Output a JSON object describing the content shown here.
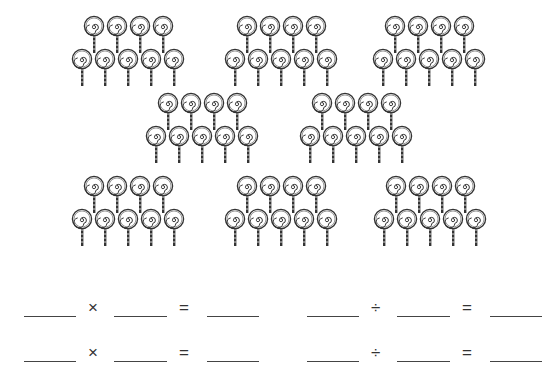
{
  "worksheet": {
    "groups": [
      {
        "x": 68,
        "y": 15,
        "top_count": 4,
        "bottom_count": 5
      },
      {
        "x": 221,
        "y": 15,
        "top_count": 4,
        "bottom_count": 5
      },
      {
        "x": 369,
        "y": 15,
        "top_count": 4,
        "bottom_count": 5
      },
      {
        "x": 142,
        "y": 92,
        "top_count": 4,
        "bottom_count": 5
      },
      {
        "x": 296,
        "y": 92,
        "top_count": 4,
        "bottom_count": 5
      },
      {
        "x": 68,
        "y": 175,
        "top_count": 4,
        "bottom_count": 5
      },
      {
        "x": 221,
        "y": 175,
        "top_count": 4,
        "bottom_count": 5
      },
      {
        "x": 370,
        "y": 175,
        "top_count": 4,
        "bottom_count": 5
      }
    ],
    "icon": "lollipop-icon",
    "equations": [
      {
        "x": 24,
        "y": 298,
        "operator": "×",
        "equals": "="
      },
      {
        "x": 24,
        "y": 343,
        "operator": "×",
        "equals": "="
      },
      {
        "x": 307,
        "y": 298,
        "operator": "÷",
        "equals": "="
      },
      {
        "x": 307,
        "y": 343,
        "operator": "÷",
        "equals": "="
      }
    ]
  }
}
